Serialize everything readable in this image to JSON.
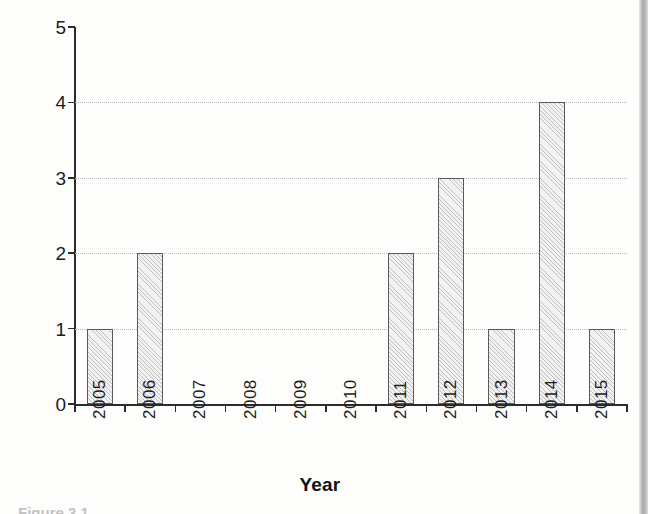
{
  "chart_data": {
    "type": "bar",
    "title": "",
    "xlabel": "Year",
    "ylabel": "Frequency of landslides",
    "categories": [
      "2005",
      "2006",
      "2007",
      "2008",
      "2009",
      "2010",
      "2011",
      "2012",
      "2013",
      "2014",
      "2015"
    ],
    "values": [
      1,
      2,
      0,
      0,
      0,
      0,
      2,
      3,
      1,
      4,
      1
    ],
    "ylim": [
      0,
      5
    ],
    "yticks": [
      "0",
      "1",
      "2",
      "3",
      "4",
      "5"
    ],
    "ytick_values": [
      0,
      1,
      2,
      3,
      4,
      5
    ],
    "gridlines": [
      1,
      2,
      3,
      4
    ],
    "grid": true,
    "legend": false,
    "bar_fill_color": "#f2f2f2",
    "bar_edge_color": "#5a5a5a",
    "bar_pattern": "diagonal-hatch",
    "axis_color": "#2b2b2b",
    "gridline_color": "#b9b9b9",
    "background_color": "#fdfdfc"
  },
  "figure": {
    "caption_remnant": "Figure 3.1",
    "scan_edge_color": "#a9a9a9"
  }
}
